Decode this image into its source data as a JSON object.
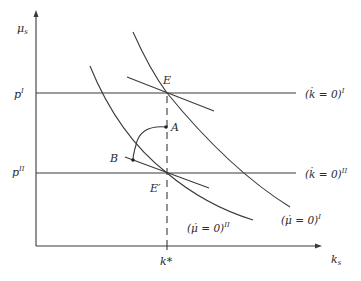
{
  "diagram": {
    "axes": {
      "y_label": "μ",
      "y_label_sub": "s",
      "x_label": "k",
      "x_label_sub": "s"
    },
    "levels": {
      "p_I": "p",
      "p_I_sup": "I",
      "p_II": "p",
      "p_II_sup": "II"
    },
    "k_star": "k*",
    "points": {
      "E": "E",
      "E_prime": "E′",
      "A": "A",
      "B": "B"
    },
    "curves": {
      "kdot_I": "(k̇ = 0)",
      "kdot_I_sup": "I",
      "kdot_II": "(k̇ = 0)",
      "kdot_II_sup": "II",
      "mudot_I": "(μ̇ = 0)",
      "mudot_I_sup": "I",
      "mudot_II": "(μ̇ = 0)",
      "mudot_II_sup": "II"
    }
  }
}
